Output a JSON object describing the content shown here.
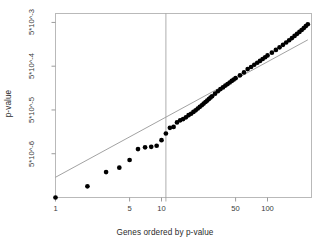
{
  "chart_data": {
    "type": "scatter",
    "title": "",
    "xlabel": "Genes ordered by p-value",
    "ylabel": "p-value",
    "xscale": "log",
    "yscale": "log",
    "grid": false,
    "legend": null,
    "xlim": [
      1,
      260
    ],
    "ylim": [
      5e-07,
      0.008
    ],
    "xticks": [
      {
        "value": 1,
        "label": "1"
      },
      {
        "value": 5,
        "label": "5"
      },
      {
        "value": 10,
        "label": "10"
      },
      {
        "value": 50,
        "label": "50"
      },
      {
        "value": 100,
        "label": "100"
      }
    ],
    "yticks": [
      {
        "value": 0.005,
        "label": "5*10^-3"
      },
      {
        "value": 0.0005,
        "label": "5*10^-4"
      },
      {
        "value": 5e-05,
        "label": "5*10^-5"
      },
      {
        "value": 5e-06,
        "label": "5*10^-6"
      }
    ],
    "annotations": [
      {
        "kind": "vline",
        "x": 11,
        "color": "#9a9a9a",
        "label": ""
      },
      {
        "kind": "refline",
        "from": [
          1,
          1.45e-06
        ],
        "to": [
          240,
          0.002
        ],
        "color": "#8a8a8a",
        "label": ""
      }
    ],
    "series": [
      {
        "name": "observed p-values",
        "marker": "filled-circle",
        "color": "#000000",
        "points": [
          [
            1,
            5e-07
          ],
          [
            2,
            9e-07
          ],
          [
            3,
            1.9e-06
          ],
          [
            4,
            2.4e-06
          ],
          [
            5,
            3.6e-06
          ],
          [
            6,
            6.4e-06
          ],
          [
            7,
            7e-06
          ],
          [
            8,
            7.2e-06
          ],
          [
            9,
            7.6e-06
          ],
          [
            10,
            1.02e-05
          ],
          [
            11,
            1.45e-05
          ],
          [
            12,
            1.95e-05
          ],
          [
            13,
            2.05e-05
          ],
          [
            14,
            2.6e-05
          ],
          [
            15,
            2.9e-05
          ],
          [
            16,
            3.1e-05
          ],
          [
            17,
            3.4e-05
          ],
          [
            18,
            3.8e-05
          ],
          [
            19,
            4.1e-05
          ],
          [
            20,
            4.5e-05
          ],
          [
            21,
            4.9e-05
          ],
          [
            22,
            5.4e-05
          ],
          [
            23,
            5.9e-05
          ],
          [
            24,
            6.4e-05
          ],
          [
            25,
            7e-05
          ],
          [
            26,
            7.6e-05
          ],
          [
            27,
            8.2e-05
          ],
          [
            28,
            8.9e-05
          ],
          [
            29,
            9.6e-05
          ],
          [
            30,
            0.000103
          ],
          [
            32,
            0.000118
          ],
          [
            34,
            0.000134
          ],
          [
            36,
            0.00015
          ],
          [
            38,
            0.000164
          ],
          [
            40,
            0.00018
          ],
          [
            42,
            0.000195
          ],
          [
            44,
            0.000212
          ],
          [
            46,
            0.00023
          ],
          [
            48,
            0.000248
          ],
          [
            50,
            0.000266
          ],
          [
            55,
            0.00031
          ],
          [
            60,
            0.00036
          ],
          [
            65,
            0.00043
          ],
          [
            70,
            0.00048
          ],
          [
            75,
            0.00054
          ],
          [
            80,
            0.0006
          ],
          [
            85,
            0.00066
          ],
          [
            90,
            0.00073
          ],
          [
            95,
            0.0008
          ],
          [
            100,
            0.00088
          ],
          [
            110,
            0.00102
          ],
          [
            120,
            0.00118
          ],
          [
            130,
            0.00135
          ],
          [
            140,
            0.00154
          ],
          [
            150,
            0.00174
          ],
          [
            160,
            0.00196
          ],
          [
            170,
            0.0022
          ],
          [
            180,
            0.00246
          ],
          [
            190,
            0.00274
          ],
          [
            200,
            0.00304
          ],
          [
            210,
            0.00336
          ],
          [
            220,
            0.00372
          ],
          [
            230,
            0.00412
          ],
          [
            240,
            0.00455
          ]
        ]
      }
    ]
  },
  "axes": {
    "xlabel": "Genes ordered by p-value",
    "ylabel": "p-value"
  }
}
